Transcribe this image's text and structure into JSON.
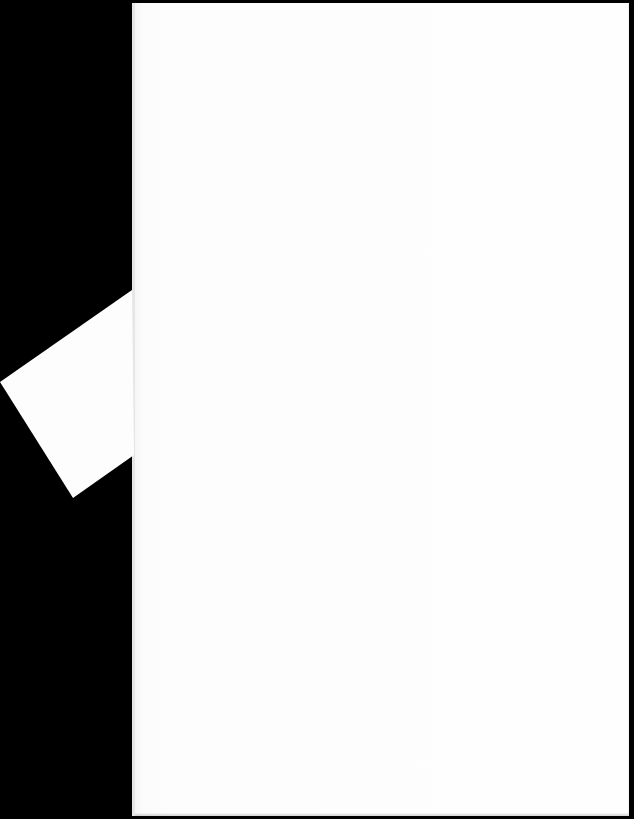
{
  "scene": {
    "description": "Blank white sheet of paper photographed on a black background with a folded corner flap on the left edge",
    "background_color": "#000000",
    "paper_color": "#fefefe",
    "flap_color": "#fdfdfd",
    "visible_text": ""
  }
}
